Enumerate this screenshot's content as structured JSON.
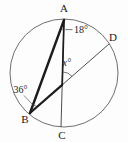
{
  "diagram": {
    "type": "circle-geometry-figure",
    "points": {
      "a": "A",
      "b": "B",
      "c": "C",
      "d": "D"
    },
    "angles": {
      "at_a": "18°",
      "at_b": "36°",
      "at_intersection": "x°"
    },
    "colors": {
      "background": "#fdfdfd",
      "circle": "#5f5f5f",
      "line": "#1c1c1c",
      "thin_line": "#3a3a3a",
      "text": "#1a1a1a"
    }
  }
}
